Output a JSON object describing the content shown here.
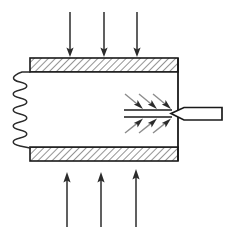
{
  "figure": {
    "kind": "technical-schematic",
    "title": "",
    "width": 234,
    "height": 237,
    "background_color": "#ffffff"
  },
  "colors": {
    "outline": "#1a1a1a",
    "hatch_line": "#3a3a3a",
    "hatch_fill": "#ffffff",
    "wall_fill": "#f2f2f2",
    "arrow_dark": "#2b2b2b",
    "arrow_gray": "#8c8c8c",
    "spring": "#2b2b2b",
    "chamber_fill": "#ffffff",
    "probe_fill": "#ffffff"
  },
  "chamber": {
    "label": "chamber-body",
    "left_x": 30,
    "right_x": 178,
    "top_wall": {
      "label": "top-wall",
      "x": 30,
      "y": 58,
      "width": 148,
      "height": 14,
      "hatched": true
    },
    "bottom_wall": {
      "label": "bottom-wall",
      "x": 30,
      "y": 147,
      "width": 148,
      "height": 14,
      "hatched": true
    },
    "interior": {
      "label": "chamber-interior",
      "x": 30,
      "y": 72,
      "width": 148,
      "height": 75
    },
    "right_wall": {
      "label": "right-wall",
      "x": 178,
      "y_top": 58,
      "y_bottom": 161
    },
    "hatch_angle_deg": 45,
    "hatch_spacing": 5
  },
  "spring": {
    "label": "coil-spring-left-boundary",
    "lead_top": {
      "x1": 30,
      "y1": 72,
      "x2": 22,
      "y2": 72
    },
    "lead_bottom": {
      "x1": 22,
      "y1": 148,
      "x2": 30,
      "y2": 148
    },
    "coil_count": 9,
    "amplitude": 9,
    "center_x": 20,
    "top_y": 74,
    "bottom_y": 146
  },
  "heat_flux_top": {
    "label": "incoming-heat-flux-top",
    "direction": "down",
    "count": 3,
    "color": "#2b2b2b",
    "arrows": [
      {
        "x": 70,
        "y_start": 12,
        "y_end": 57
      },
      {
        "x": 104,
        "y_start": 12,
        "y_end": 57
      },
      {
        "x": 137,
        "y_start": 12,
        "y_end": 57
      }
    ]
  },
  "heat_flux_bottom": {
    "label": "incoming-heat-flux-bottom",
    "direction": "up",
    "count": 3,
    "color": "#2b2b2b",
    "arrows": [
      {
        "x": 67,
        "y_start": 227,
        "y_end": 174
      },
      {
        "x": 101,
        "y_start": 227,
        "y_end": 174
      },
      {
        "x": 136,
        "y_start": 227,
        "y_end": 174
      }
    ]
  },
  "convergent_flow_upper": {
    "label": "converging-flow-arrows-upper",
    "direction": "down-right",
    "count": 3,
    "shaft_color": "#8c8c8c",
    "head_color": "#2b2b2b",
    "arrows": [
      {
        "x1": 125,
        "y1": 94,
        "x2": 142,
        "y2": 108
      },
      {
        "x1": 139,
        "y1": 94,
        "x2": 156,
        "y2": 108
      },
      {
        "x1": 153,
        "y1": 94,
        "x2": 170,
        "y2": 108
      }
    ]
  },
  "convergent_flow_lower": {
    "label": "converging-flow-arrows-lower",
    "direction": "up-right",
    "count": 3,
    "shaft_color": "#8c8c8c",
    "head_color": "#2b2b2b",
    "arrows": [
      {
        "x1": 125,
        "y1": 133,
        "x2": 142,
        "y2": 119
      },
      {
        "x1": 139,
        "y1": 133,
        "x2": 156,
        "y2": 119
      },
      {
        "x1": 153,
        "y1": 133,
        "x2": 170,
        "y2": 119
      }
    ]
  },
  "axis_lines": {
    "label": "converging-axis-lines",
    "upper": {
      "x1": 124,
      "y1": 110,
      "x2": 172,
      "y2": 110
    },
    "lower": {
      "x1": 124,
      "y1": 117,
      "x2": 172,
      "y2": 117
    }
  },
  "probe": {
    "label": "probe-nozzle",
    "tip_x": 171,
    "tip_y": 113.5,
    "shoulder_x": 184,
    "top_y": 108,
    "bottom_y": 120,
    "end_x": 222,
    "description": "pointed probe extending right through chamber wall"
  }
}
